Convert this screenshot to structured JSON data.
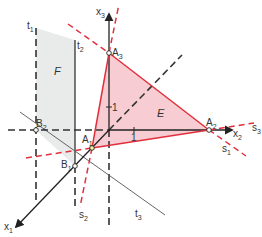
{
  "diagram": {
    "type": "3d-coordinate-system",
    "axes": {
      "x1": {
        "label": "x",
        "sub": "1"
      },
      "x2": {
        "label": "x",
        "sub": "2"
      },
      "x3": {
        "label": "x",
        "sub": "3"
      }
    },
    "ticks": {
      "x2_tick": "1",
      "x3_tick": "1"
    },
    "points": {
      "A1": {
        "label": "A",
        "sub": "1"
      },
      "A2": {
        "label": "A",
        "sub": "2"
      },
      "A3": {
        "label": "A",
        "sub": "3"
      },
      "B1": {
        "label": "B",
        "sub": "1"
      },
      "B2": {
        "label": "B",
        "sub": "2"
      }
    },
    "lines": {
      "s1": {
        "label": "s",
        "sub": "1"
      },
      "s2": {
        "label": "s",
        "sub": "2"
      },
      "s3": {
        "label": "s",
        "sub": "3"
      },
      "t1": {
        "label": "t",
        "sub": "1"
      },
      "t2": {
        "label": "t",
        "sub": "2"
      },
      "t3": {
        "label": "t",
        "sub": "3"
      }
    },
    "regions": {
      "E": {
        "label": "E"
      },
      "F": {
        "label": "F"
      }
    },
    "colors": {
      "red": "#e0303c",
      "pink_fill": "#f7cdd3",
      "gray_fill": "#e9eaea",
      "axis": "#222222",
      "dashed": "#333333"
    }
  }
}
